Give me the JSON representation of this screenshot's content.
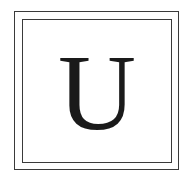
{
  "monogram": {
    "letter": "U",
    "frame_color": "#3a3a3a",
    "letter_color": "#1a1a1a"
  }
}
